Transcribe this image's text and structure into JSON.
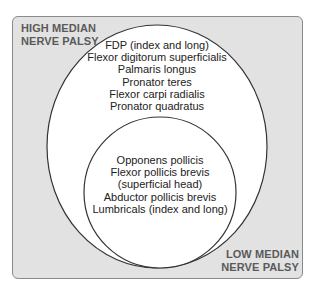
{
  "diagram": {
    "type": "nested-venn",
    "background_color": "#e2e2e2",
    "outer_set": {
      "label_lines": [
        "HIGH MEDIAN",
        "NERVE PALSY"
      ],
      "muscles": [
        "FDP (index and long)",
        "Flexor digitorum superficialis",
        "Palmaris longus",
        "Pronator teres",
        "Flexor carpi radialis",
        "Pronator quadratus"
      ]
    },
    "inner_set": {
      "label_lines": [
        "LOW MEDIAN",
        "NERVE PALSY"
      ],
      "muscles": [
        "Opponens pollicis",
        "Flexor pollicis brevis",
        "(superficial head)",
        "Abductor pollicis brevis",
        "Lumbricals (index and long)"
      ]
    }
  }
}
